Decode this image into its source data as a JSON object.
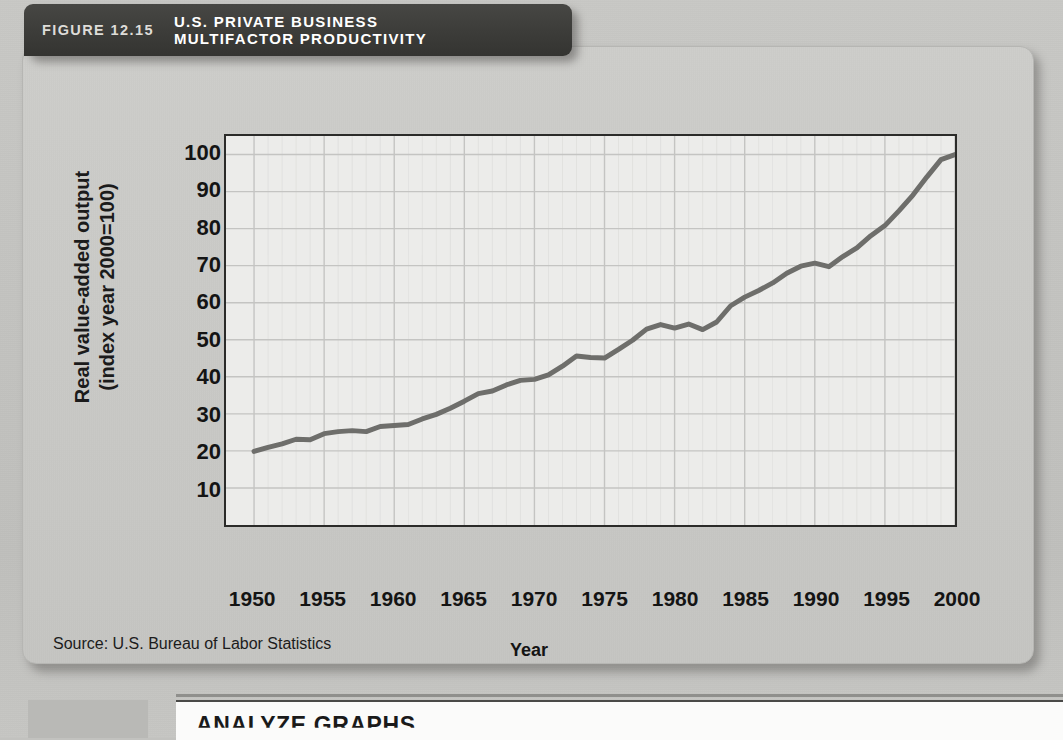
{
  "figure": {
    "number_label": "FIGURE 12.15",
    "title": "U.S. PRIVATE BUSINESS\nMULTIFACTOR PRODUCTIVITY",
    "source": "Source: U.S. Bureau of Labor Statistics"
  },
  "bottom_section": {
    "heading": "ANALYZE GRAPHS"
  },
  "colors": {
    "banner_bg": "#3c3c39",
    "banner_text": "#ffffff",
    "card_bg": "#c9c9c6",
    "plot_bg": "#ececea",
    "axis": "#2b2b29",
    "gridline": "#c4c4c2",
    "line": "#6e6e6b",
    "page_bg": "#c2c2bf"
  },
  "page_background_ghost_text": {
    "headline_line1": "America Races to Crystallize",
    "headline_line2": "a New Federation",
    "body": [
      "standards and",
      "The main sub-",
      "such as family"
    ]
  },
  "chart_data": {
    "type": "line",
    "title": "U.S. PRIVATE BUSINESS MULTIFACTOR PRODUCTIVITY",
    "xlabel": "Year",
    "ylabel": "Real value-added output\n(index year 2000=100)",
    "xlim": [
      1948,
      2000
    ],
    "ylim": [
      0,
      105
    ],
    "xticks": [
      1950,
      1955,
      1960,
      1965,
      1970,
      1975,
      1980,
      1985,
      1990,
      1995,
      2000
    ],
    "yticks": [
      10,
      20,
      30,
      40,
      50,
      60,
      70,
      80,
      90,
      100
    ],
    "grid": true,
    "legend": "none",
    "series": [
      {
        "name": "Real value-added output (index year 2000=100)",
        "x": [
          1950,
          1951,
          1952,
          1953,
          1954,
          1955,
          1956,
          1957,
          1958,
          1959,
          1960,
          1961,
          1962,
          1963,
          1964,
          1965,
          1966,
          1967,
          1968,
          1969,
          1970,
          1971,
          1972,
          1973,
          1974,
          1975,
          1976,
          1977,
          1978,
          1979,
          1980,
          1981,
          1982,
          1983,
          1984,
          1985,
          1986,
          1987,
          1988,
          1989,
          1990,
          1991,
          1992,
          1993,
          1994,
          1995,
          1996,
          1997,
          1998,
          1999,
          2000
        ],
        "values": [
          14.5,
          15.3,
          16.0,
          16.9,
          16.8,
          18.0,
          18.4,
          18.6,
          18.4,
          19.4,
          19.6,
          19.8,
          20.9,
          21.8,
          23.0,
          24.4,
          25.9,
          26.4,
          27.6,
          28.5,
          28.7,
          29.6,
          31.3,
          33.3,
          33.0,
          32.9,
          34.6,
          36.4,
          38.6,
          39.5,
          38.8,
          39.6,
          38.5,
          40.0,
          43.2,
          44.9,
          46.2,
          47.7,
          49.6,
          51.0,
          51.6,
          50.9,
          52.9,
          54.6,
          57.0,
          59.0,
          61.9,
          65.0,
          68.6,
          72.0,
          73.0
        ]
      }
    ],
    "annotations": [
      {
        "text": "plateau 1958-1961 near index 19-20"
      },
      {
        "text": "1974-1975 slowdown near index 33"
      },
      {
        "text": "1979-1982 plateau near index 48"
      },
      {
        "text": "1990-1991 plateau near index 68"
      },
      {
        "text": "reaches index 100 in year 2000"
      }
    ]
  }
}
